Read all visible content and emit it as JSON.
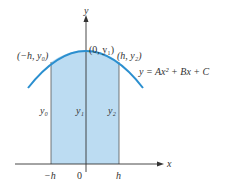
{
  "figure": {
    "colors": {
      "curve": "#2b8fcf",
      "region_fill": "#bcdcf2",
      "axis": "#333333",
      "ordinate": "#555555"
    },
    "axes": {
      "x_label": "x",
      "y_label": "y"
    },
    "x_ticks": {
      "neg_h": "−h",
      "zero": "0",
      "h": "h"
    },
    "points": {
      "left": "(−h, y₀)",
      "center": "(0, y₁)",
      "right": "(h, y₂)"
    },
    "ordinate_labels": {
      "y0": "y₀",
      "y1": "y₁",
      "y2": "y₂"
    },
    "equation": "y = Ax² + Bx + C"
  }
}
